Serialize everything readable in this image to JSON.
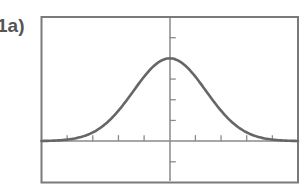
{
  "figure": {
    "label": "1a)"
  },
  "colors": {
    "frame": "#7a7a7a",
    "axis": "#8a8a8a",
    "curve": "#666666",
    "label": "#555555",
    "background": "#ffffff"
  },
  "chart_data": {
    "type": "line",
    "title": "",
    "xlabel": "",
    "ylabel": "",
    "xlim": [
      -5,
      5
    ],
    "ylim": [
      -2,
      6
    ],
    "xscl": 1,
    "yscl": 1,
    "grid": false,
    "legend": null,
    "x_ticks": [
      -4,
      -3,
      -2,
      -1,
      1,
      2,
      3,
      4
    ],
    "y_ticks": [
      -1,
      1,
      2,
      3,
      4,
      5
    ],
    "tick_labels_shown": false,
    "function": "y = 4*exp(-x^2/4)",
    "series": [
      {
        "name": "bell curve",
        "x": [
          -5,
          -4.5,
          -4,
          -3.5,
          -3,
          -2.5,
          -2,
          -1.5,
          -1,
          -0.5,
          0,
          0.5,
          1,
          1.5,
          2,
          2.5,
          3,
          3.5,
          4,
          4.5,
          5
        ],
        "y": [
          0.01,
          0.03,
          0.07,
          0.19,
          0.42,
          0.84,
          1.47,
          2.28,
          3.12,
          3.76,
          4.0,
          3.76,
          3.12,
          2.28,
          1.47,
          0.84,
          0.42,
          0.19,
          0.07,
          0.03,
          0.01
        ]
      }
    ],
    "annotations": []
  }
}
